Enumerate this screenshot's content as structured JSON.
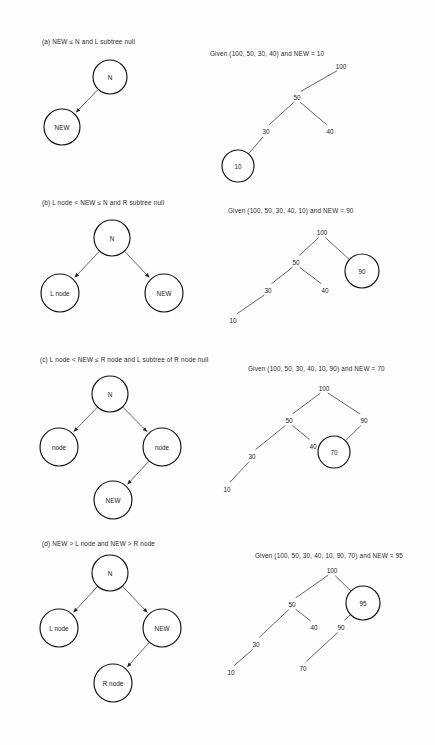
{
  "figure": {
    "title_present": false,
    "background_color": "#fefefe",
    "ink_color": "#111111"
  },
  "sections": [
    {
      "id": "a",
      "caption": "(a) NEW ≤ N and L subtree null",
      "given": "Given (100, 50, 30, 40) and NEW = 10",
      "schematic": {
        "nodes": [
          {
            "name": "n-node",
            "label": "N",
            "cx": 110,
            "cy": 77,
            "r": 17,
            "bold": false
          },
          {
            "name": "new-node",
            "label": "NEW",
            "cx": 62,
            "cy": 127,
            "r": 18,
            "bold": true
          }
        ],
        "edges": [
          {
            "from": "n-node",
            "to": "new-node",
            "arrow": true
          }
        ]
      },
      "example_tree": {
        "nodes": [
          {
            "name": "value-100",
            "label": "100",
            "x": 341,
            "y": 66,
            "circled": false
          },
          {
            "name": "value-50",
            "label": "50",
            "x": 297,
            "y": 97,
            "circled": false
          },
          {
            "name": "value-30",
            "label": "30",
            "x": 266,
            "y": 131,
            "circled": false
          },
          {
            "name": "value-40",
            "label": "40",
            "x": 330,
            "y": 131,
            "circled": false
          },
          {
            "name": "value-10",
            "label": "10",
            "x": 238,
            "y": 166,
            "circled": true,
            "r": 16
          }
        ],
        "edges": [
          {
            "from": "value-100",
            "to": "value-50"
          },
          {
            "from": "value-50",
            "to": "value-30"
          },
          {
            "from": "value-50",
            "to": "value-40"
          },
          {
            "from": "value-30",
            "to": "value-10"
          }
        ]
      }
    },
    {
      "id": "b",
      "caption": "(b) L node < NEW ≤ N and R subtree null",
      "given": "Given (100, 50, 30, 40, 10) and NEW = 90",
      "schematic": {
        "nodes": [
          {
            "name": "n-node",
            "label": "N",
            "cx": 112,
            "cy": 238,
            "r": 18,
            "bold": false
          },
          {
            "name": "l-node",
            "label": "L node",
            "cx": 60,
            "cy": 293,
            "r": 19,
            "bold": true
          },
          {
            "name": "new-node",
            "label": "NEW",
            "cx": 164,
            "cy": 293,
            "r": 19,
            "bold": true
          }
        ],
        "edges": [
          {
            "from": "n-node",
            "to": "l-node",
            "arrow": true
          },
          {
            "from": "n-node",
            "to": "new-node",
            "arrow": true
          }
        ]
      },
      "example_tree": {
        "nodes": [
          {
            "name": "value-100",
            "label": "100",
            "x": 322,
            "y": 232,
            "circled": false
          },
          {
            "name": "value-50",
            "label": "50",
            "x": 296,
            "y": 262,
            "circled": false
          },
          {
            "name": "value-30",
            "label": "30",
            "x": 268,
            "y": 290,
            "circled": false
          },
          {
            "name": "value-40",
            "label": "40",
            "x": 325,
            "y": 290,
            "circled": false
          },
          {
            "name": "value-10",
            "label": "10",
            "x": 233,
            "y": 320,
            "circled": false
          },
          {
            "name": "value-90",
            "label": "90",
            "x": 362,
            "y": 271,
            "circled": true,
            "r": 17
          }
        ],
        "edges": [
          {
            "from": "value-100",
            "to": "value-50"
          },
          {
            "from": "value-100",
            "to": "value-90"
          },
          {
            "from": "value-50",
            "to": "value-30"
          },
          {
            "from": "value-50",
            "to": "value-40"
          },
          {
            "from": "value-30",
            "to": "value-10"
          }
        ]
      }
    },
    {
      "id": "c",
      "caption": "(c) L node < NEW ≤ R node and L subtree of R node null",
      "given": "Given (100, 50, 30, 40, 10, 90) and NEW = 70",
      "schematic": {
        "nodes": [
          {
            "name": "n-node",
            "label": "N",
            "cx": 110,
            "cy": 394,
            "r": 18,
            "bold": false
          },
          {
            "name": "l-node",
            "label": "node",
            "cx": 59,
            "cy": 447,
            "r": 19,
            "bold": true
          },
          {
            "name": "r-node",
            "label": "node",
            "cx": 162,
            "cy": 447,
            "r": 19,
            "bold": true
          },
          {
            "name": "new-node",
            "label": "NEW",
            "cx": 113,
            "cy": 500,
            "r": 19,
            "bold": true
          }
        ],
        "edges": [
          {
            "from": "n-node",
            "to": "l-node",
            "arrow": true
          },
          {
            "from": "n-node",
            "to": "r-node",
            "arrow": true
          },
          {
            "from": "r-node",
            "to": "new-node",
            "arrow": true
          }
        ]
      },
      "example_tree": {
        "nodes": [
          {
            "name": "value-100",
            "label": "100",
            "x": 324,
            "y": 388,
            "circled": false
          },
          {
            "name": "value-50",
            "label": "50",
            "x": 289,
            "y": 420,
            "circled": false
          },
          {
            "name": "value-90",
            "label": "90",
            "x": 364,
            "y": 420,
            "circled": false
          },
          {
            "name": "value-30",
            "label": "30",
            "x": 252,
            "y": 456,
            "circled": false
          },
          {
            "name": "value-40",
            "label": "40",
            "x": 313,
            "y": 446,
            "circled": false
          },
          {
            "name": "value-10",
            "label": "10",
            "x": 227,
            "y": 489,
            "circled": false
          },
          {
            "name": "value-70",
            "label": "70",
            "x": 334,
            "y": 452,
            "circled": true,
            "r": 16
          }
        ],
        "edges": [
          {
            "from": "value-100",
            "to": "value-50"
          },
          {
            "from": "value-100",
            "to": "value-90"
          },
          {
            "from": "value-50",
            "to": "value-30"
          },
          {
            "from": "value-50",
            "to": "value-40"
          },
          {
            "from": "value-30",
            "to": "value-10"
          },
          {
            "from": "value-90",
            "to": "value-70"
          }
        ]
      }
    },
    {
      "id": "d",
      "caption": "(d) NEW > L node and NEW > R node",
      "given": "Given (100, 50, 30, 40, 10, 90, 70) and NEW = 95",
      "schematic": {
        "nodes": [
          {
            "name": "n-node",
            "label": "N",
            "cx": 110,
            "cy": 573,
            "r": 18,
            "bold": false
          },
          {
            "name": "l-node",
            "label": "L node",
            "cx": 59,
            "cy": 628,
            "r": 19,
            "bold": true
          },
          {
            "name": "new-node",
            "label": "NEW",
            "cx": 162,
            "cy": 628,
            "r": 19,
            "bold": true
          },
          {
            "name": "r-node",
            "label": "R node",
            "cx": 113,
            "cy": 683,
            "r": 19,
            "bold": true
          }
        ],
        "edges": [
          {
            "from": "n-node",
            "to": "l-node",
            "arrow": true
          },
          {
            "from": "n-node",
            "to": "new-node",
            "arrow": true
          },
          {
            "from": "new-node",
            "to": "r-node",
            "arrow": true
          }
        ]
      },
      "example_tree": {
        "nodes": [
          {
            "name": "value-100",
            "label": "100",
            "x": 332,
            "y": 570,
            "circled": false
          },
          {
            "name": "value-50",
            "label": "50",
            "x": 292,
            "y": 604,
            "circled": false
          },
          {
            "name": "value-30",
            "label": "30",
            "x": 256,
            "y": 644,
            "circled": false
          },
          {
            "name": "value-40",
            "label": "40",
            "x": 314,
            "y": 627,
            "circled": false
          },
          {
            "name": "value-90",
            "label": "90",
            "x": 341,
            "y": 627,
            "circled": false
          },
          {
            "name": "value-10",
            "label": "10",
            "x": 231,
            "y": 672,
            "circled": false
          },
          {
            "name": "value-70",
            "label": "70",
            "x": 303,
            "y": 668,
            "circled": false
          },
          {
            "name": "value-95",
            "label": "95",
            "x": 363,
            "y": 603,
            "circled": true,
            "r": 17
          }
        ],
        "edges": [
          {
            "from": "value-100",
            "to": "value-50"
          },
          {
            "from": "value-100",
            "to": "value-95"
          },
          {
            "from": "value-50",
            "to": "value-30"
          },
          {
            "from": "value-50",
            "to": "value-40"
          },
          {
            "from": "value-30",
            "to": "value-10"
          },
          {
            "from": "value-95",
            "to": "value-90"
          },
          {
            "from": "value-90",
            "to": "value-70"
          }
        ]
      }
    }
  ],
  "caption_positions": [
    {
      "id": "a",
      "left": 42,
      "top": 38
    },
    {
      "id": "b",
      "left": 42,
      "top": 199
    },
    {
      "id": "c",
      "left": 40,
      "top": 356
    },
    {
      "id": "d",
      "left": 42,
      "top": 540
    }
  ],
  "given_positions": [
    {
      "id": "a",
      "left": 210,
      "top": 50
    },
    {
      "id": "b",
      "left": 228,
      "top": 207
    },
    {
      "id": "c",
      "left": 248,
      "top": 365
    },
    {
      "id": "d",
      "left": 255,
      "top": 552
    }
  ]
}
